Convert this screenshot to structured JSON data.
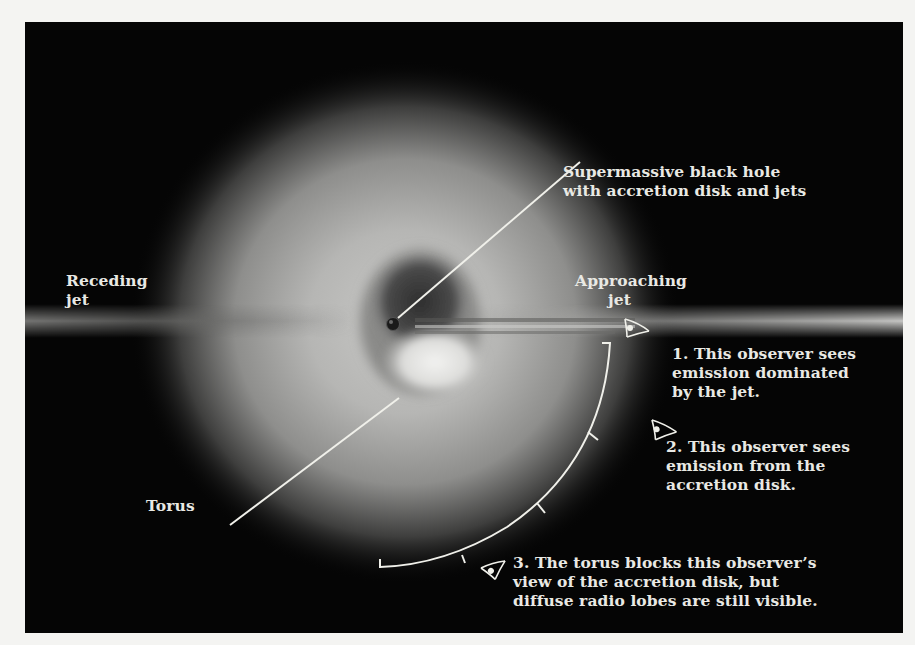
{
  "figure": {
    "colors": {
      "background": "#050505",
      "page": "#f4f4f2",
      "text": "#e9e9e4",
      "leader_lines": "#f0f0ea"
    },
    "labels": {
      "black_hole": "Supermassive black hole\nwith accretion disk and jets",
      "receding_jet": "Receding\njet",
      "approaching_jet": "Approaching\n      jet",
      "torus": "Torus"
    },
    "observers": [
      {
        "number": "1",
        "text": "1. This observer sees\nemission dominated\nby the jet."
      },
      {
        "number": "2",
        "text": "2. This observer sees\nemission from the\naccretion disk."
      },
      {
        "number": "3",
        "text": "3. The torus blocks this observer’s\nview of the accretion disk, but\ndiffuse radio lobes are still visible."
      }
    ],
    "icons": {
      "observer_icon": "eye-icon"
    }
  }
}
